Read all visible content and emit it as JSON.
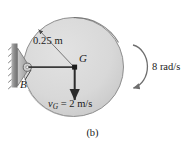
{
  "figure": {
    "caption": "(b)",
    "labels": {
      "radius": "0.25 m",
      "center_of_mass": "G",
      "pin_point": "B",
      "velocity": "= 2 m/s",
      "velocity_symbol": "v",
      "velocity_subscript": "G",
      "angular_velocity": "8 rad/s"
    },
    "values": {
      "radius_m": 0.25,
      "velocity_m_per_s": 2,
      "angular_velocity_rad_per_s": 8,
      "rotation_sense": "clockwise"
    },
    "colors": {
      "disk_fill": "#d9d9d9",
      "disk_edge": "#8a8a8a",
      "line": "#3a3a3a",
      "support": "#9a9a9a",
      "text": "#1a1a1a"
    }
  }
}
